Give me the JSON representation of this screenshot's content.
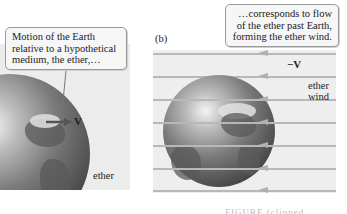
{
  "panel_a": {
    "callout": "Motion of the Earth relative to a hypothetical medium, the ether,…",
    "vector_label": "V",
    "medium_label": "ether"
  },
  "panel_b": {
    "label": "(b)",
    "callout": "…corresponds to flow of the ether past Earth, forming the ether wind.",
    "vector_label": "−V",
    "wind_label_line1": "ether",
    "wind_label_line2": "wind",
    "flow_direction": "right-to-left",
    "flow_line_count": 7
  },
  "caption": {
    "text": "FIGURE (clipped, illegible)"
  },
  "colors": {
    "panel_bg": "#ececec",
    "callout_border": "#9a9a9a",
    "arrow": "#555555",
    "flow_line": "#b8b8b8"
  }
}
